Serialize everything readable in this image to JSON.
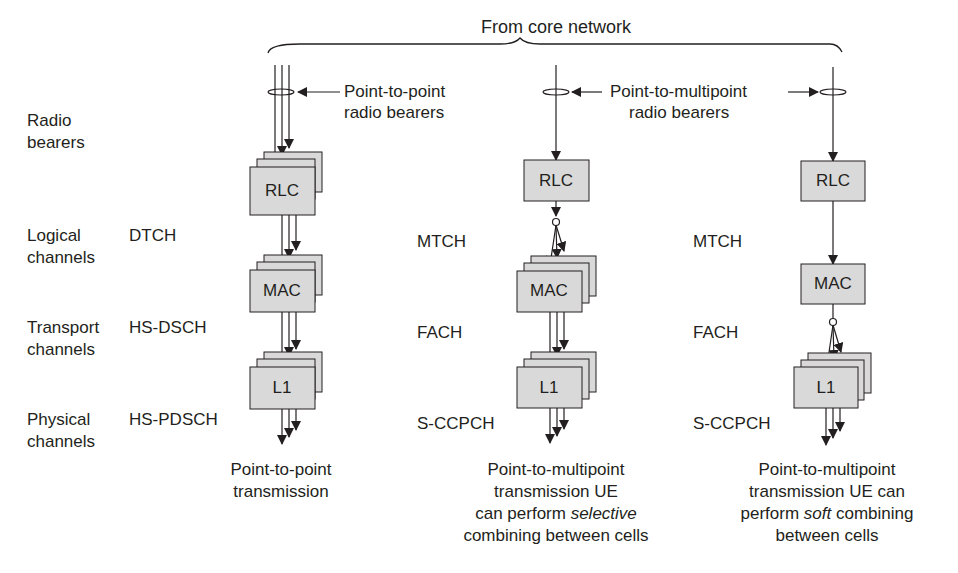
{
  "title": "From core network",
  "annotations": {
    "p2p_bearers_line1": "Point-to-point",
    "p2p_bearers_line2": "radio bearers",
    "p2m_bearers_line1": "Point-to-multipoint",
    "p2m_bearers_line2": "radio bearers"
  },
  "row_labels": [
    {
      "line1": "Radio",
      "line2": "bearers"
    },
    {
      "line1": "Logical",
      "line2": "channels"
    },
    {
      "line1": "Transport",
      "line2": "channels"
    },
    {
      "line1": "Physical",
      "line2": "channels"
    }
  ],
  "columns": [
    {
      "name": "point-to-point",
      "logical": "DTCH",
      "transport": "HS-DSCH",
      "physical": "HS-PDSCH",
      "blocks": [
        "RLC",
        "MAC",
        "L1"
      ],
      "caption": [
        "Point-to-point",
        "transmission"
      ]
    },
    {
      "name": "p2m-selective",
      "logical": "MTCH",
      "transport": "FACH",
      "physical": "S-CCPCH",
      "blocks": [
        "RLC",
        "MAC",
        "L1"
      ],
      "caption": [
        "Point-to-multipoint",
        "transmission UE",
        "can perform ",
        "selective",
        "combining between cells"
      ]
    },
    {
      "name": "p2m-soft",
      "logical": "MTCH",
      "transport": "FACH",
      "physical": "S-CCPCH",
      "blocks": [
        "RLC",
        "MAC",
        "L1"
      ],
      "caption": [
        "Point-to-multipoint",
        "transmission UE can",
        "perform ",
        "soft",
        " combining",
        "between cells"
      ]
    }
  ],
  "colors": {
    "box_fill": "#d9d9d9",
    "line": "#231f20",
    "background": "#ffffff"
  }
}
